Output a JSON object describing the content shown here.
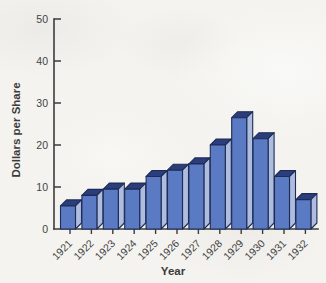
{
  "figure": {
    "background": "#f4f3ef"
  },
  "chart_data": {
    "type": "bar",
    "title": "",
    "xlabel": "Year",
    "ylabel": "Dollars per Share",
    "categories": [
      "1921",
      "1922",
      "1923",
      "1924",
      "1925",
      "1926",
      "1927",
      "1928",
      "1929",
      "1930",
      "1931",
      "1932"
    ],
    "values": [
      5.5,
      8,
      9.5,
      9.5,
      12.5,
      14,
      15.5,
      20,
      26.5,
      21.5,
      12.5,
      7
    ],
    "ylim": [
      0,
      50
    ],
    "yticks": [
      0,
      10,
      20,
      30,
      40,
      50
    ],
    "grid": false,
    "legend": null,
    "bar_style": "pseudo-3d",
    "colors": {
      "bar_front": "#5b7ac4",
      "bar_side": "#adbcdf",
      "bar_top": "#2c3d7c",
      "bar_outline": "#1e2c55",
      "axis": "#3c3c3c",
      "text": "#434343"
    }
  }
}
